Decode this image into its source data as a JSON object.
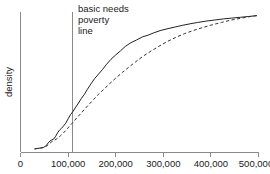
{
  "chart_data": {
    "type": "line",
    "title": "",
    "xlabel": "",
    "ylabel": "density",
    "xlim": [
      0,
      500000
    ],
    "ylim": [
      0,
      1
    ],
    "grid": false,
    "legend_position": "none",
    "xticks": [
      0,
      100000,
      200000,
      300000,
      400000,
      500000
    ],
    "xticklabels": [
      "0",
      "100,000",
      "200,000",
      "300,000",
      "400,000",
      "500,000"
    ],
    "yticks": [],
    "yticklabels": [],
    "annotations": [
      {
        "name": "basic-needs-poverty-line",
        "lines": [
          "basic needs",
          "poverty",
          "line"
        ],
        "x_value": 110000,
        "type": "vertical-reference-line"
      }
    ],
    "series": [
      {
        "name": "solid-curve",
        "style": "solid",
        "x": [
          30000,
          36000,
          42000,
          48000,
          54000,
          58000,
          62000,
          66000,
          70000,
          74000,
          78000,
          82000,
          86000,
          90000,
          95000,
          100000,
          105000,
          110000,
          116000,
          122000,
          128000,
          134000,
          140000,
          148000,
          156000,
          164000,
          172000,
          180000,
          190000,
          200000,
          210000,
          220000,
          232000,
          244000,
          256000,
          268000,
          280000,
          295000,
          310000,
          325000,
          340000,
          356000,
          372000,
          390000,
          408000,
          426000,
          444000,
          462000,
          480000,
          496000
        ],
        "y": [
          0.012,
          0.015,
          0.018,
          0.022,
          0.035,
          0.055,
          0.07,
          0.078,
          0.085,
          0.105,
          0.13,
          0.15,
          0.162,
          0.178,
          0.2,
          0.232,
          0.262,
          0.285,
          0.318,
          0.348,
          0.382,
          0.41,
          0.445,
          0.488,
          0.528,
          0.56,
          0.592,
          0.628,
          0.668,
          0.7,
          0.73,
          0.762,
          0.79,
          0.81,
          0.832,
          0.845,
          0.862,
          0.88,
          0.893,
          0.905,
          0.917,
          0.928,
          0.938,
          0.948,
          0.956,
          0.964,
          0.97,
          0.976,
          0.982,
          0.988
        ]
      },
      {
        "name": "dashed-curve",
        "style": "dashed",
        "x": [
          30000,
          38000,
          46000,
          54000,
          60000,
          66000,
          72000,
          78000,
          84000,
          90000,
          96000,
          102000,
          110000,
          118000,
          126000,
          134000,
          144000,
          154000,
          164000,
          176000,
          188000,
          200000,
          214000,
          228000,
          242000,
          258000,
          274000,
          290000,
          308000,
          326000,
          344000,
          362000,
          382000,
          402000,
          422000,
          442000,
          462000,
          480000,
          496000
        ],
        "y": [
          0.012,
          0.016,
          0.02,
          0.03,
          0.048,
          0.065,
          0.076,
          0.09,
          0.108,
          0.128,
          0.15,
          0.175,
          0.205,
          0.238,
          0.268,
          0.3,
          0.338,
          0.375,
          0.412,
          0.452,
          0.492,
          0.53,
          0.572,
          0.612,
          0.65,
          0.692,
          0.728,
          0.762,
          0.798,
          0.828,
          0.855,
          0.878,
          0.9,
          0.92,
          0.938,
          0.955,
          0.968,
          0.98,
          0.988
        ]
      }
    ]
  },
  "colors": {
    "axis": "#8a8a8a",
    "solid_curve": "#222222",
    "dashed_curve": "#333333",
    "text": "#1a1a1a",
    "background": "#ffffff"
  }
}
